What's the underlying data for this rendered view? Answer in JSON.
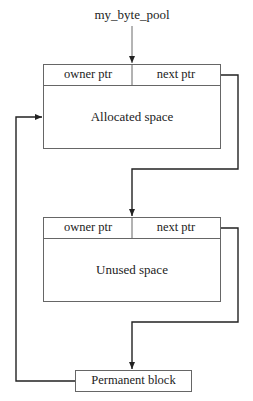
{
  "diagram": {
    "pool_label": "my_byte_pool",
    "blocks": [
      {
        "owner_label": "owner ptr",
        "next_label": "next ptr",
        "body_label": "Allocated space"
      },
      {
        "owner_label": "owner ptr",
        "next_label": "next ptr",
        "body_label": "Unused space"
      }
    ],
    "permanent_block_label": "Permanent block"
  }
}
